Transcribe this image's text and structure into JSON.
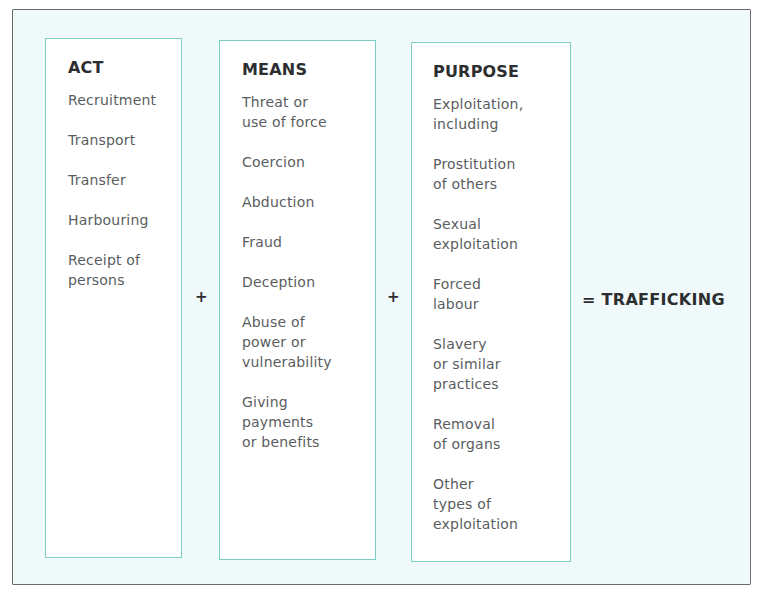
{
  "diagram": {
    "columns": [
      {
        "title": "ACT",
        "items": [
          "Recruitment",
          "Transport",
          "Transfer",
          "Harbouring",
          "Receipt of\npersons"
        ]
      },
      {
        "title": "MEANS",
        "items": [
          "Threat or\nuse of force",
          "Coercion",
          "Abduction",
          "Fraud",
          "Deception",
          "Abuse of\npower or\nvulnerability",
          "Giving\npayments\nor benefits"
        ]
      },
      {
        "title": "PURPOSE",
        "items": [
          "Exploitation,\nincluding",
          "Prostitution\nof others",
          "Sexual\nexploitation",
          "Forced\nlabour",
          "Slavery\nor similar\npractices",
          "Removal\nof organs",
          "Other\ntypes of\nexploitation"
        ]
      }
    ],
    "operators": [
      "+",
      "+"
    ],
    "result": "= TRAFFICKING",
    "colors": {
      "box_border": "#7ccdc2",
      "background": "#f1fafb",
      "frame_border": "#6b6b6b"
    }
  }
}
